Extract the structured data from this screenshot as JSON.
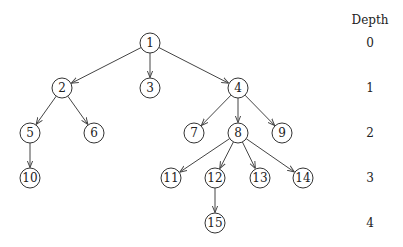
{
  "diagram": {
    "type": "tree",
    "depth_header": "Depth",
    "depth_levels": [
      {
        "label": "0",
        "y": 43
      },
      {
        "label": "1",
        "y": 88
      },
      {
        "label": "2",
        "y": 133
      },
      {
        "label": "3",
        "y": 178
      },
      {
        "label": "4",
        "y": 223
      }
    ],
    "depth_x": 370,
    "depth_header_y": 20,
    "node_radius": 10,
    "nodes": [
      {
        "id": "1",
        "x": 150,
        "y": 43,
        "depth": 0
      },
      {
        "id": "2",
        "x": 62,
        "y": 88,
        "depth": 1
      },
      {
        "id": "3",
        "x": 150,
        "y": 88,
        "depth": 1
      },
      {
        "id": "4",
        "x": 238,
        "y": 88,
        "depth": 1
      },
      {
        "id": "5",
        "x": 30,
        "y": 133,
        "depth": 2
      },
      {
        "id": "6",
        "x": 94,
        "y": 133,
        "depth": 2
      },
      {
        "id": "7",
        "x": 194,
        "y": 133,
        "depth": 2
      },
      {
        "id": "8",
        "x": 238,
        "y": 133,
        "depth": 2
      },
      {
        "id": "9",
        "x": 282,
        "y": 133,
        "depth": 2
      },
      {
        "id": "10",
        "x": 30,
        "y": 178,
        "depth": 3
      },
      {
        "id": "11",
        "x": 171,
        "y": 178,
        "depth": 3
      },
      {
        "id": "12",
        "x": 215,
        "y": 178,
        "depth": 3
      },
      {
        "id": "13",
        "x": 260,
        "y": 178,
        "depth": 3
      },
      {
        "id": "14",
        "x": 303,
        "y": 178,
        "depth": 3
      },
      {
        "id": "15",
        "x": 215,
        "y": 223,
        "depth": 4
      }
    ],
    "edges": [
      [
        "1",
        "2"
      ],
      [
        "1",
        "3"
      ],
      [
        "1",
        "4"
      ],
      [
        "2",
        "5"
      ],
      [
        "2",
        "6"
      ],
      [
        "4",
        "7"
      ],
      [
        "4",
        "8"
      ],
      [
        "4",
        "9"
      ],
      [
        "5",
        "10"
      ],
      [
        "8",
        "11"
      ],
      [
        "8",
        "12"
      ],
      [
        "8",
        "13"
      ],
      [
        "8",
        "14"
      ],
      [
        "12",
        "15"
      ]
    ]
  }
}
